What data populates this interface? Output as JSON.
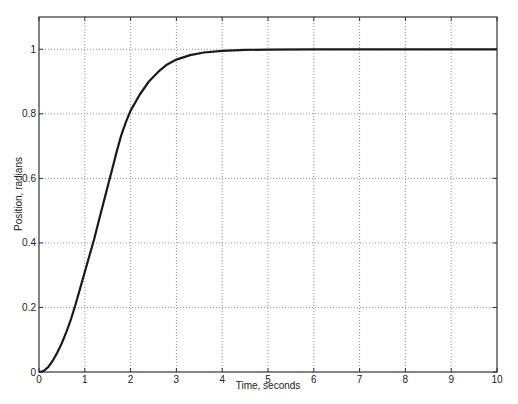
{
  "chart_data": {
    "type": "line",
    "title": "",
    "xlabel": "Time, seconds",
    "ylabel": "Position, radians",
    "xlim": [
      0,
      10
    ],
    "ylim": [
      0,
      1.1
    ],
    "xticks": [
      0,
      1,
      2,
      3,
      4,
      5,
      6,
      7,
      8,
      9,
      10
    ],
    "yticks": [
      0,
      0.2,
      0.4,
      0.6,
      0.8,
      1
    ],
    "ytick_labels": [
      "0",
      "0.2",
      "0.4",
      "0.6",
      "0.8",
      "1"
    ],
    "grid": true,
    "legend": null,
    "series": [
      {
        "name": "position",
        "color": "#1a1a1a",
        "x": [
          0,
          0.1,
          0.2,
          0.3,
          0.4,
          0.5,
          0.6,
          0.7,
          0.8,
          0.9,
          1.0,
          1.1,
          1.2,
          1.3,
          1.4,
          1.5,
          1.6,
          1.7,
          1.8,
          1.9,
          2.0,
          2.2,
          2.4,
          2.6,
          2.8,
          3.0,
          3.3,
          3.6,
          4.0,
          4.5,
          5.0,
          6.0,
          7.0,
          8.0,
          9.0,
          10.0
        ],
        "y": [
          0,
          0.003,
          0.015,
          0.035,
          0.06,
          0.09,
          0.125,
          0.165,
          0.21,
          0.26,
          0.31,
          0.36,
          0.41,
          0.465,
          0.52,
          0.575,
          0.63,
          0.685,
          0.735,
          0.775,
          0.81,
          0.86,
          0.9,
          0.93,
          0.953,
          0.968,
          0.982,
          0.99,
          0.995,
          0.998,
          0.999,
          1.0,
          1.0,
          1.0,
          1.0,
          1.0
        ]
      }
    ]
  }
}
